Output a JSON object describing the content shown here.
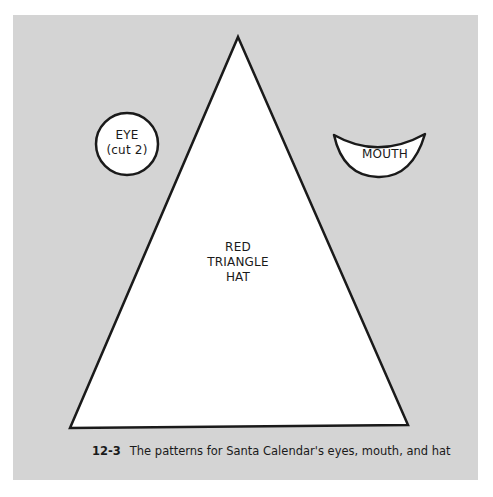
{
  "figure": {
    "background_color": "#d4d4d4",
    "shapes": {
      "eye": {
        "label_line1": "EYE",
        "label_line2": "(cut 2)"
      },
      "mouth": {
        "label": "MOUTH"
      },
      "hat": {
        "label_line1": "RED",
        "label_line2": "TRIANGLE",
        "label_line3": "HAT"
      }
    },
    "caption": {
      "number": "12-3",
      "text": "The patterns for Santa Calendar's eyes, mouth, and hat"
    }
  }
}
